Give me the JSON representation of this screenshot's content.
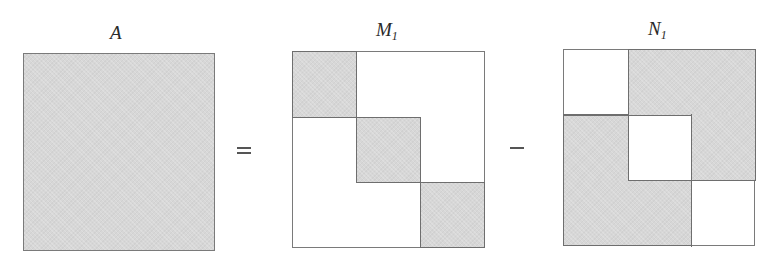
{
  "diagram": {
    "type": "matrix-splitting",
    "equation": "A = M1 - N1",
    "colors": {
      "shaded_fill": "#d7d7d7",
      "border": "#777777",
      "background": "#ffffff"
    },
    "operators": {
      "equals": "=",
      "minus": "−"
    },
    "matrices": [
      {
        "id": "A",
        "label": "A",
        "subscript": "",
        "grid": [
          [
            1
          ]
        ],
        "description": "fully shaded (dense) matrix"
      },
      {
        "id": "M1",
        "label": "M",
        "subscript": "1",
        "grid": [
          [
            1,
            0,
            0
          ],
          [
            0,
            1,
            0
          ],
          [
            0,
            0,
            1
          ]
        ],
        "description": "block diagonal part shaded"
      },
      {
        "id": "N1",
        "label": "N",
        "subscript": "1",
        "grid": [
          [
            0,
            1,
            1
          ],
          [
            1,
            0,
            1
          ],
          [
            1,
            1,
            0
          ]
        ],
        "description": "off-diagonal blocks shaded"
      }
    ]
  }
}
